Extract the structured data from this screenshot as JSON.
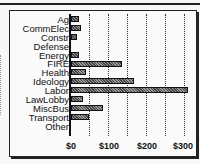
{
  "chart_data": {
    "type": "bar",
    "orientation": "horizontal",
    "title": "",
    "xlabel": "",
    "ylabel": "",
    "categories": [
      "Ag",
      "CommElec",
      "Constr",
      "Defense",
      "Energy",
      "FIRE",
      "Health",
      "Ideology",
      "Labor",
      "LawLobby",
      "MiscBus",
      "Transport",
      "Other"
    ],
    "values": [
      21,
      26,
      16,
      0,
      21,
      134,
      39,
      166,
      308,
      32,
      84,
      47,
      0
    ],
    "xlim": [
      0,
      310
    ],
    "xticks": [
      "$0",
      "$100",
      "$200",
      "$300"
    ],
    "grid": "vertical dotted every $50",
    "legend": "none"
  }
}
